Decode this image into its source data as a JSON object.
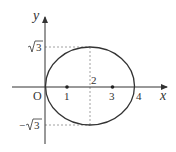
{
  "figure": {
    "axes": {
      "x_label": "x",
      "y_label": "y",
      "origin_label": "O"
    },
    "x_ticks": [
      {
        "value": 1,
        "label": "1",
        "marked_point": true
      },
      {
        "value": 2,
        "label": "2",
        "marked_point": false
      },
      {
        "value": 3,
        "label": "3",
        "marked_point": true
      },
      {
        "value": 4,
        "label": "4",
        "marked_point": false
      }
    ],
    "y_ticks": [
      {
        "label_radical": "3",
        "label_prefix": "",
        "value": 1.732
      },
      {
        "label_radical": "3",
        "label_prefix": "−",
        "value": -1.732
      }
    ],
    "ellipse": {
      "center": [
        2,
        0
      ],
      "semi_axis_x": 2,
      "semi_axis_y": 1.732,
      "equation": "(x-2)^2/4 + y^2/3 = 1"
    },
    "colors": {
      "stroke": "#333333",
      "dashed": "#888888"
    }
  }
}
